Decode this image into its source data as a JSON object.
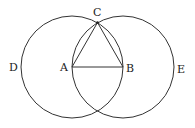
{
  "diagram": {
    "stroke_color": "#333333",
    "points": {
      "A": {
        "label": "A",
        "x": 72,
        "y": 67
      },
      "B": {
        "label": "B",
        "x": 123,
        "y": 67
      },
      "C": {
        "label": "C",
        "x": 97.5,
        "y": 22.5
      }
    },
    "circles": [
      {
        "center": "A",
        "radius": 51,
        "label": "D"
      },
      {
        "center": "B",
        "radius": 51,
        "label": "E"
      }
    ],
    "segments": [
      [
        "A",
        "B"
      ],
      [
        "A",
        "C"
      ],
      [
        "B",
        "C"
      ]
    ],
    "labels": {
      "A": "A",
      "B": "B",
      "C": "C",
      "D": "D",
      "E": "E"
    }
  }
}
